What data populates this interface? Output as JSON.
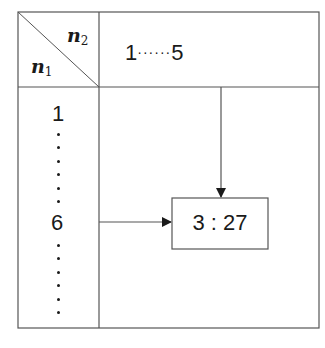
{
  "table": {
    "corner": {
      "top_right_var": "n",
      "top_right_sub": "2",
      "bottom_left_var": "n",
      "bottom_left_sub": "1"
    },
    "header": {
      "start": "1",
      "dots": "······",
      "end": "5"
    },
    "rows": {
      "first": "1",
      "middle": "6"
    },
    "result_box": {
      "value": "3 : 27"
    }
  },
  "colors": {
    "line": "#555555",
    "text": "#1a1a1a",
    "background": "#ffffff"
  }
}
